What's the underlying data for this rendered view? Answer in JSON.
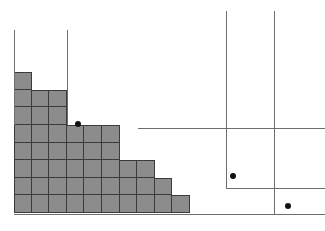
{
  "figure": {
    "title": "",
    "width": 325,
    "height": 231,
    "background_color": "#ffffff"
  },
  "style": {
    "cell_fill_color": "#8c8c8c",
    "cell_border_color": "#3a3a3a",
    "line_color": "#6e6e6e",
    "dot_color": "#111111",
    "cell_size": 17.6,
    "line_width": 1,
    "dot_radius": 3.4
  },
  "chart_data": {
    "type": "diagram",
    "title": "",
    "subtitle": "",
    "xlabel": "",
    "ylabel": "",
    "grid": true,
    "legend_position": "none",
    "origin": {
      "x": 14,
      "y": 213
    },
    "cell_size": 17.6,
    "columns": [
      {
        "index": 1,
        "height_cells": 8
      },
      {
        "index": 2,
        "height_cells": 7
      },
      {
        "index": 3,
        "height_cells": 7
      },
      {
        "index": 4,
        "height_cells": 5
      },
      {
        "index": 5,
        "height_cells": 5
      },
      {
        "index": 6,
        "height_cells": 5
      },
      {
        "index": 7,
        "height_cells": 3
      },
      {
        "index": 8,
        "height_cells": 3
      },
      {
        "index": 9,
        "height_cells": 2
      },
      {
        "index": 10,
        "height_cells": 1
      }
    ],
    "row_lengths_cells": [
      1,
      3,
      3,
      6,
      6,
      8,
      9,
      10
    ],
    "total_cells": 46,
    "vertical_rays": [
      {
        "name": "left-ray-1",
        "x": 14,
        "y_top": 30,
        "y_bottom": 125
      },
      {
        "name": "left-ray-2",
        "x": 67,
        "y_top": 30,
        "y_bottom": 125
      },
      {
        "name": "right-ray-1",
        "x": 226,
        "y_top": 11,
        "y_bottom": 188
      },
      {
        "name": "right-ray-2",
        "x": 274,
        "y_top": 11,
        "y_bottom": 214
      }
    ],
    "horizontal_rays": [
      {
        "name": "upper-right-ray",
        "y": 128,
        "x_left": 138,
        "x_right": 325
      },
      {
        "name": "lower-right-ray",
        "y": 188,
        "x_left": 226,
        "x_right": 325
      },
      {
        "name": "baseline-ray",
        "y": 214,
        "x_left": 14,
        "x_right": 325
      }
    ],
    "dots": [
      {
        "name": "dot-1",
        "x": 78,
        "y": 124
      },
      {
        "name": "dot-2",
        "x": 233,
        "y": 176
      },
      {
        "name": "dot-3",
        "x": 288,
        "y": 206
      }
    ]
  }
}
